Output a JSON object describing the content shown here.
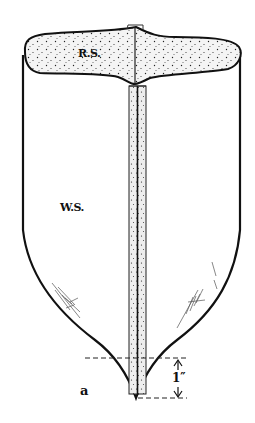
{
  "figure": {
    "labels": {
      "rim_surface": "R.S.",
      "wall_surface": "W.S.",
      "point": "a",
      "dimension": "1″"
    },
    "colors": {
      "stroke": "#111111",
      "stipple_fill": "#f4f4f4",
      "background": "#ffffff",
      "hatch": "#555555"
    }
  }
}
